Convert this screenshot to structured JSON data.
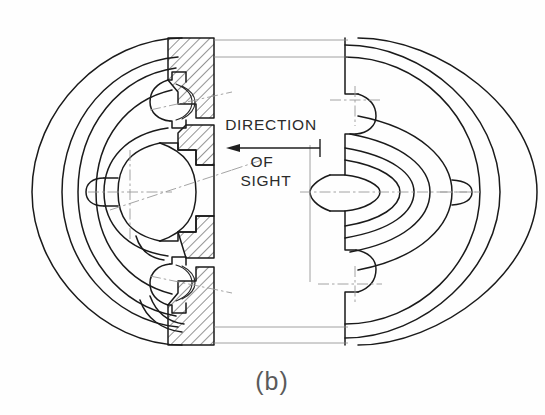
{
  "figure": {
    "caption": "(b)",
    "kind": "half-section-assembly-drawing",
    "background_color": "#fefefe",
    "line_color": "#1a1a1a",
    "thin_line_color": "#8c8c8c",
    "center_line_color": "#9a9a9a"
  },
  "annotation": {
    "line1": "DIRECTION",
    "line2": "OF",
    "line3": "SIGHT",
    "arrow_direction": "left"
  },
  "labels": {
    "section_side": "left-hatched-cut",
    "solid_side": "right-uncut"
  }
}
